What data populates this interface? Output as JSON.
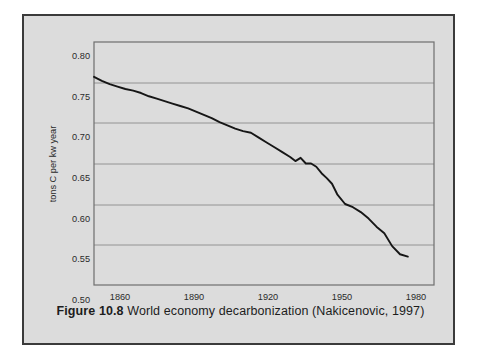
{
  "figure": {
    "caption_prefix": "Figure 10.8",
    "caption_text": "World economy decarbonization (Nakicenovic, 1997)"
  },
  "chart_data": {
    "type": "line",
    "title": "",
    "xlabel": "",
    "ylabel": "tons C per kw year",
    "xlim": [
      1860,
      1990
    ],
    "ylim": [
      0.5,
      0.8
    ],
    "grid": true,
    "legend": "none",
    "xticks": [
      1860,
      1890,
      1920,
      1950,
      1980
    ],
    "yticks": [
      "0.50",
      "0.55",
      "0.60",
      "0.65",
      "0.70",
      "0.75",
      "0.80"
    ],
    "series": [
      {
        "name": "World average carbon intensity",
        "x": [
          1860,
          1863,
          1866,
          1869,
          1872,
          1875,
          1878,
          1881,
          1884,
          1887,
          1890,
          1893,
          1896,
          1899,
          1902,
          1905,
          1908,
          1911,
          1914,
          1917,
          1920,
          1923,
          1926,
          1929,
          1932,
          1935,
          1937,
          1939,
          1941,
          1943,
          1945,
          1947,
          1949,
          1951,
          1953,
          1956,
          1959,
          1962,
          1965,
          1968,
          1971,
          1974,
          1977,
          1980
        ],
        "y": [
          0.757,
          0.752,
          0.748,
          0.745,
          0.742,
          0.74,
          0.737,
          0.733,
          0.73,
          0.727,
          0.724,
          0.721,
          0.718,
          0.714,
          0.71,
          0.706,
          0.701,
          0.697,
          0.693,
          0.69,
          0.688,
          0.682,
          0.676,
          0.67,
          0.664,
          0.658,
          0.653,
          0.657,
          0.65,
          0.65,
          0.646,
          0.638,
          0.632,
          0.625,
          0.612,
          0.6,
          0.596,
          0.59,
          0.582,
          0.572,
          0.564,
          0.548,
          0.538,
          0.535
        ]
      }
    ]
  },
  "accent_colors": {
    "panel_background": "#dcdcdc",
    "panel_border": "#3b3b3b",
    "line_color": "#161616",
    "grid_color": "#8a8a8a"
  }
}
